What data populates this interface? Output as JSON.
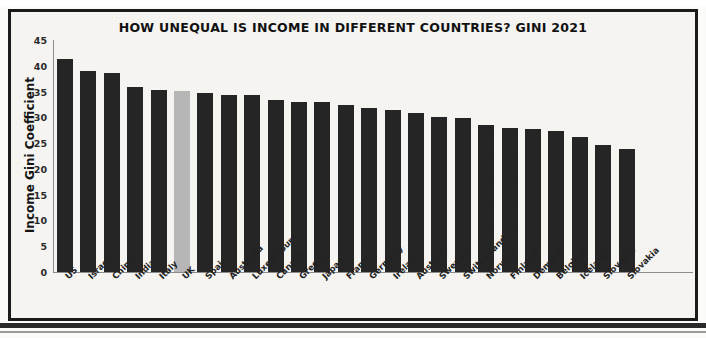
{
  "chart_data": {
    "type": "bar",
    "title": "HOW UNEQUAL IS INCOME IN DIFFERENT COUNTRIES? GINI 2021",
    "xlabel": "",
    "ylabel": "Income Gini Coefficient",
    "ylim": [
      0,
      45
    ],
    "yticks": [
      0,
      5,
      10,
      15,
      20,
      25,
      30,
      35,
      40,
      45
    ],
    "grid": false,
    "legend": "none",
    "highlight_category": "UK",
    "bar_color": "#252525",
    "highlight_color": "#b6b6b6",
    "categories": [
      "US",
      "Israel",
      "China",
      "India",
      "Italy",
      "UK",
      "Spain",
      "Australia",
      "Luxembourg",
      "Canada",
      "Greece",
      "Japan",
      "France",
      "Germany",
      "Ireland",
      "Austria",
      "Sweden",
      "Switzerland",
      "Norway",
      "Finland",
      "Demark",
      "Belgium",
      "Iceland",
      "Slovenia",
      "Slovakia"
    ],
    "values": [
      41.4,
      39.0,
      38.6,
      35.8,
      35.3,
      35.1,
      34.7,
      34.4,
      34.3,
      33.4,
      33.0,
      32.9,
      32.4,
      31.8,
      31.4,
      30.9,
      30.1,
      29.8,
      28.6,
      27.9,
      27.8,
      27.3,
      26.2,
      24.7,
      23.8
    ]
  }
}
